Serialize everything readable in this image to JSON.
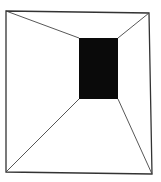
{
  "figure": {
    "type": "perspective-room-line-drawing",
    "width": 161,
    "height": 182,
    "colors": {
      "background": "#ffffff",
      "stroke": "#333333",
      "back_wall": "#0a0a0a"
    },
    "outer_frame": {
      "top_left": [
        6,
        11
      ],
      "top_right": [
        149,
        13
      ],
      "bottom_right": [
        152,
        174
      ],
      "bottom_left": [
        6,
        172
      ]
    },
    "back_wall": {
      "top_left": [
        79,
        38
      ],
      "top_right": [
        118,
        38
      ],
      "bottom_right": [
        118,
        99
      ],
      "bottom_left": [
        79,
        99
      ]
    }
  }
}
